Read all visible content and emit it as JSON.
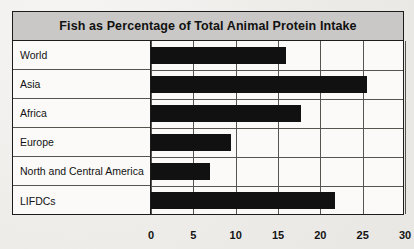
{
  "chart_data": {
    "type": "bar",
    "orientation": "horizontal",
    "title": "Fish as Percentage of Total Animal Protein Intake",
    "categories": [
      "World",
      "Asia",
      "Africa",
      "Europe",
      "North and Central America",
      "LIFDCs"
    ],
    "values": [
      16,
      25.5,
      17.7,
      9.5,
      7,
      21.7
    ],
    "xlabel": "",
    "ylabel": "",
    "xlim": [
      0,
      30
    ],
    "xticks": [
      0,
      5,
      10,
      15,
      20,
      25,
      30
    ],
    "xtick_labels": [
      "0",
      "5",
      "10",
      "15",
      "20",
      "25",
      "30"
    ],
    "grid": true,
    "legend": false,
    "bar_color": "#111111",
    "title_band_color": "#c9c8c6",
    "frame_color": "#1c1c1c",
    "plot_background": "#fbfaf8"
  }
}
